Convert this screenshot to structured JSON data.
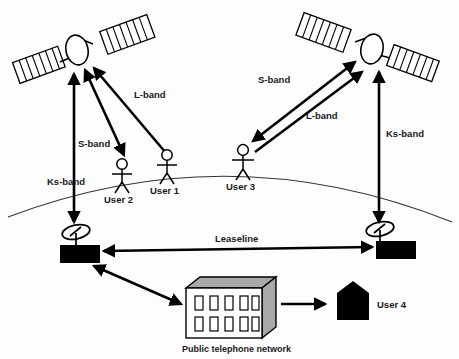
{
  "diagram": {
    "background_color": "#ffffff",
    "line_color": "#000000",
    "shade_color": "#a8a8a8"
  },
  "satellites": [
    {
      "id": "satellite-left",
      "name": "Left satellite"
    },
    {
      "id": "satellite-right",
      "name": "Right satellite"
    }
  ],
  "users": [
    {
      "id": "user-1",
      "label": "User 1"
    },
    {
      "id": "user-2",
      "label": "User 2"
    },
    {
      "id": "user-3",
      "label": "User 3"
    },
    {
      "id": "user-4",
      "label": "User 4"
    }
  ],
  "ground_stations": [
    {
      "id": "ground-station-left",
      "name": "Left ground station"
    },
    {
      "id": "ground-station-right",
      "name": "Right ground station"
    }
  ],
  "links": [
    {
      "id": "link-ks-band-left",
      "label": "Ks-band"
    },
    {
      "id": "link-s-band-left",
      "label": "S-band"
    },
    {
      "id": "link-l-band-left",
      "label": "L-band"
    },
    {
      "id": "link-s-band-right",
      "label": "S-band"
    },
    {
      "id": "link-l-band-right",
      "label": "L-band"
    },
    {
      "id": "link-ks-band-right",
      "label": "Ks-band"
    },
    {
      "id": "link-leaseline",
      "label": "Leaseline"
    }
  ],
  "labels": {
    "ks_band_left": "Ks-band",
    "s_band_left": "S-band",
    "l_band_left": "L-band",
    "s_band_right": "S-band",
    "l_band_right": "L-band",
    "ks_band_right": "Ks-band",
    "leaseline": "Leaseline",
    "public_telephone_network": "Public telephone network",
    "user_1": "User 1",
    "user_2": "User 2",
    "user_3": "User 3",
    "user_4": "User 4"
  },
  "nodes": {
    "public_telephone_network": "Public telephone network"
  }
}
